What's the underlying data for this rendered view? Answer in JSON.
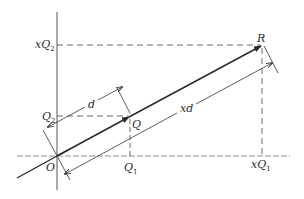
{
  "diagram": {
    "type": "vector-scaling-geometry",
    "labels": {
      "origin": "O",
      "point_q": "Q",
      "point_r": "R",
      "q1": "Q",
      "q1_sub": "1",
      "q2": "Q",
      "q2_sub": "2",
      "xq1_prefix": "x",
      "xq1": "Q",
      "xq1_sub": "1",
      "xq2_prefix": "x",
      "xq2": "Q",
      "xq2_sub": "2",
      "dim_d": "d",
      "dim_xd": "xd"
    },
    "colors": {
      "line": "#2a2a2a",
      "axis": "#555555",
      "background": "#ffffff"
    }
  }
}
